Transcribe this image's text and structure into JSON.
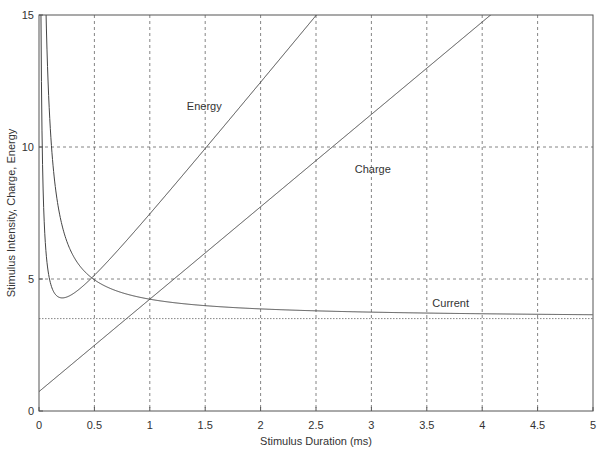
{
  "chart_data": {
    "type": "line",
    "title": "",
    "xlabel": "Stimulus Duration (ms)",
    "ylabel": "Stimulus Intensity, Charge, Energy",
    "xlim": [
      0,
      5
    ],
    "ylim": [
      0,
      15
    ],
    "xticks": [
      0,
      0.5,
      1,
      1.5,
      2,
      2.5,
      3,
      3.5,
      4,
      4.5,
      5
    ],
    "xtick_labels": [
      "0",
      "0.5",
      "1",
      "1.5",
      "2",
      "2.5",
      "3",
      "3.5",
      "4",
      "4.5",
      "5"
    ],
    "yticks": [
      0,
      5,
      10,
      15
    ],
    "ytick_labels": [
      "0",
      "5",
      "10",
      "15"
    ],
    "grid": true,
    "legend": "none (inline curve labels)",
    "series": [
      {
        "name": "Current",
        "label_position": {
          "x": 3.55,
          "y": 3.95
        },
        "formula": "I = 3.5 * (1 + 0.21 / t)",
        "x": [
          0.05,
          0.1,
          0.2,
          0.3,
          0.5,
          0.75,
          1,
          1.5,
          2,
          2.5,
          3,
          3.5,
          4,
          4.5,
          5
        ],
        "values": [
          14.7,
          10.85,
          7.18,
          5.95,
          4.97,
          4.48,
          4.24,
          3.99,
          3.87,
          3.79,
          3.75,
          3.71,
          3.68,
          3.66,
          3.65
        ]
      },
      {
        "name": "Charge",
        "label_position": {
          "x": 2.85,
          "y": 9.0
        },
        "formula": "Q = 0.735 + 3.5 * t",
        "x": [
          0,
          0.5,
          1,
          1.5,
          2,
          2.5,
          3,
          3.5,
          4,
          4.08
        ],
        "values": [
          0.74,
          2.49,
          4.24,
          5.99,
          7.74,
          9.49,
          11.24,
          12.99,
          14.74,
          15.0
        ]
      },
      {
        "name": "Energy",
        "label_position": {
          "x": 1.65,
          "y": 11.4
        },
        "formula": "E = 5.1 * (t + 0.21)^2 / t",
        "x": [
          0.02,
          0.05,
          0.1,
          0.2,
          0.3,
          0.5,
          0.75,
          1,
          1.5,
          2,
          2.5,
          2.6
        ],
        "values": [
          15.0,
          6.9,
          4.9,
          4.3,
          4.42,
          5.14,
          6.27,
          7.47,
          9.94,
          12.45,
          14.98,
          15.5
        ]
      },
      {
        "name": "Rheobase threshold",
        "style": "dotted",
        "x": [
          0,
          5
        ],
        "values": [
          3.5,
          3.5
        ]
      }
    ],
    "labels": {
      "current": "Current",
      "charge": "Charge",
      "energy": "Energy"
    }
  }
}
